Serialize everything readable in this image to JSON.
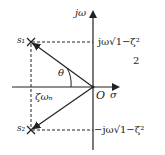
{
  "diagram": {
    "type": "s-plane pole location diagram",
    "axes": {
      "vertical_label": "jω",
      "horizontal_label": "σ",
      "origin_label": "O"
    },
    "poles": [
      {
        "id": "s1",
        "label": "s₁",
        "imag_label": "jω√1−ζ²",
        "imag_extra": "2"
      },
      {
        "id": "s2",
        "label": "s₂",
        "imag_label": "−jω√1−ζ²"
      }
    ],
    "angle_label": "θ",
    "real_part_label": "ζωₙ",
    "colors": {
      "line": "#222222",
      "background": "#ffffff"
    }
  }
}
